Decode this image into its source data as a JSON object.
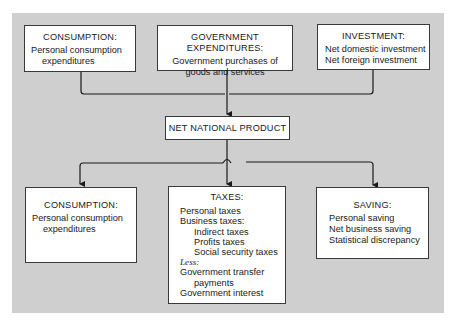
{
  "diagram": {
    "top_boxes": [
      {
        "title": "CONSUMPTION:",
        "lines": [
          "Personal consumption",
          "expenditures"
        ]
      },
      {
        "title": "GOVERNMENT EXPENDITURES:",
        "lines": [
          "Government purchases of",
          "goods and services"
        ]
      },
      {
        "title": "INVESTMENT:",
        "lines": [
          "Net domestic investment",
          "Net foreign investment"
        ]
      }
    ],
    "center_box": {
      "title": "NET NATIONAL PRODUCT"
    },
    "bottom_boxes": {
      "consumption": {
        "title": "CONSUMPTION:",
        "lines": [
          "Personal consumption",
          "expenditures"
        ]
      },
      "taxes": {
        "title": "TAXES:",
        "personal": "Personal taxes",
        "business": "Business taxes:",
        "business_items": [
          "Indirect taxes",
          "Profits taxes",
          "Social security taxes"
        ],
        "less_label": "Less:",
        "less_items": [
          "Government transfer",
          "payments",
          "Government interest"
        ]
      },
      "saving": {
        "title": "SAVING:",
        "lines": [
          "Personal saving",
          "Net business saving",
          "Statistical discrepancy"
        ]
      }
    },
    "colors": {
      "panel": "#cfcfcf",
      "box": "#ffffff",
      "line": "#1a1a1a"
    }
  }
}
